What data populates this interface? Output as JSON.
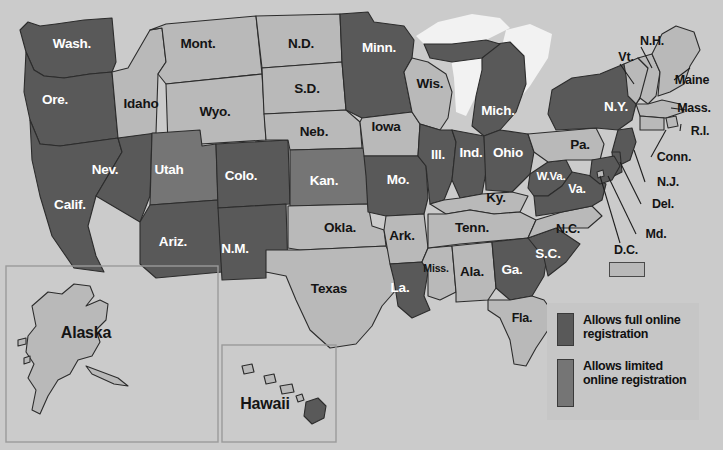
{
  "map": {
    "title": "United States online voter registration map",
    "colors": {
      "full": "#595959",
      "limited": "#757575",
      "none": "#b9b9b9",
      "water": "#f2f2f2",
      "background": "#cbcbcb",
      "border": "#2c2c2c",
      "legend_panel": "#c6c6c6"
    },
    "states": [
      {
        "abbr": "WA",
        "label": "Wash.",
        "status": "full",
        "x": 72,
        "y": 44
      },
      {
        "abbr": "OR",
        "label": "Ore.",
        "status": "full",
        "x": 55,
        "y": 100
      },
      {
        "abbr": "CA",
        "label": "Calif.",
        "status": "full",
        "x": 70,
        "y": 205
      },
      {
        "abbr": "NV",
        "label": "Nev.",
        "status": "full",
        "x": 105,
        "y": 170
      },
      {
        "abbr": "ID",
        "label": "Idaho",
        "status": "none",
        "x": 141,
        "y": 104
      },
      {
        "abbr": "MT",
        "label": "Mont.",
        "status": "none",
        "x": 198,
        "y": 44
      },
      {
        "abbr": "WY",
        "label": "Wyo.",
        "status": "none",
        "x": 215,
        "y": 112
      },
      {
        "abbr": "UT",
        "label": "Utah",
        "status": "limited",
        "x": 169,
        "y": 170
      },
      {
        "abbr": "AZ",
        "label": "Ariz.",
        "status": "full",
        "x": 173,
        "y": 242
      },
      {
        "abbr": "CO",
        "label": "Colo.",
        "status": "full",
        "x": 241,
        "y": 176
      },
      {
        "abbr": "NM",
        "label": "N.M.",
        "status": "full",
        "x": 235,
        "y": 249
      },
      {
        "abbr": "ND",
        "label": "N.D.",
        "status": "none",
        "x": 301,
        "y": 44
      },
      {
        "abbr": "SD",
        "label": "S.D.",
        "status": "none",
        "x": 307,
        "y": 89
      },
      {
        "abbr": "NE",
        "label": "Neb.",
        "status": "none",
        "x": 314,
        "y": 132
      },
      {
        "abbr": "KS",
        "label": "Kan.",
        "status": "limited",
        "x": 324,
        "y": 181
      },
      {
        "abbr": "OK",
        "label": "Okla.",
        "status": "none",
        "x": 340,
        "y": 228
      },
      {
        "abbr": "TX",
        "label": "Texas",
        "status": "none",
        "x": 329,
        "y": 289
      },
      {
        "abbr": "MN",
        "label": "Minn.",
        "status": "full",
        "x": 379,
        "y": 48
      },
      {
        "abbr": "IA",
        "label": "Iowa",
        "status": "none",
        "x": 386,
        "y": 127
      },
      {
        "abbr": "MO",
        "label": "Mo.",
        "status": "full",
        "x": 398,
        "y": 180
      },
      {
        "abbr": "AR",
        "label": "Ark.",
        "status": "none",
        "x": 402,
        "y": 236
      },
      {
        "abbr": "LA",
        "label": "La.",
        "status": "full",
        "x": 400,
        "y": 288
      },
      {
        "abbr": "WI",
        "label": "Wis.",
        "status": "none",
        "x": 430,
        "y": 84
      },
      {
        "abbr": "IL",
        "label": "Ill.",
        "status": "full",
        "x": 438,
        "y": 155
      },
      {
        "abbr": "MS",
        "label": "Miss.",
        "status": "none",
        "x": 436,
        "y": 268
      },
      {
        "abbr": "MI",
        "label": "Mich.",
        "status": "full",
        "x": 498,
        "y": 111
      },
      {
        "abbr": "IN",
        "label": "Ind.",
        "status": "full",
        "x": 471,
        "y": 153
      },
      {
        "abbr": "OH",
        "label": "Ohio",
        "status": "full",
        "x": 508,
        "y": 153
      },
      {
        "abbr": "KY",
        "label": "Ky.",
        "status": "none",
        "x": 496,
        "y": 198
      },
      {
        "abbr": "TN",
        "label": "Tenn.",
        "status": "none",
        "x": 472,
        "y": 228
      },
      {
        "abbr": "AL",
        "label": "Ala.",
        "status": "none",
        "x": 472,
        "y": 272
      },
      {
        "abbr": "GA",
        "label": "Ga.",
        "status": "full",
        "x": 512,
        "y": 270
      },
      {
        "abbr": "FL",
        "label": "Fla.",
        "status": "none",
        "x": 522,
        "y": 318
      },
      {
        "abbr": "SC",
        "label": "S.C.",
        "status": "full",
        "x": 548,
        "y": 254
      },
      {
        "abbr": "NC",
        "label": "N.C.",
        "status": "none",
        "x": 568,
        "y": 229
      },
      {
        "abbr": "WV",
        "label": "W.Va.",
        "status": "full",
        "x": 551,
        "y": 177
      },
      {
        "abbr": "VA",
        "label": "Va.",
        "status": "full",
        "x": 577,
        "y": 189
      },
      {
        "abbr": "PA",
        "label": "Pa.",
        "status": "none",
        "x": 580,
        "y": 145
      },
      {
        "abbr": "NY",
        "label": "N.Y.",
        "status": "full",
        "x": 616,
        "y": 107
      }
    ],
    "callouts": [
      {
        "abbr": "NH",
        "label": "N.H.",
        "x": 652,
        "y": 41
      },
      {
        "abbr": "VT",
        "label": "Vt.",
        "x": 626,
        "y": 57
      },
      {
        "abbr": "ME",
        "label": "Maine",
        "x": 692,
        "y": 80
      },
      {
        "abbr": "MA",
        "label": "Mass.",
        "x": 694,
        "y": 108
      },
      {
        "abbr": "RI",
        "label": "R.I.",
        "x": 700,
        "y": 131
      },
      {
        "abbr": "CT",
        "label": "Conn.",
        "x": 674,
        "y": 157
      },
      {
        "abbr": "NJ",
        "label": "N.J.",
        "x": 668,
        "y": 182
      },
      {
        "abbr": "DE",
        "label": "Del.",
        "x": 663,
        "y": 204
      },
      {
        "abbr": "MD",
        "label": "Md.",
        "x": 656,
        "y": 234
      },
      {
        "abbr": "DC",
        "label": "D.C.",
        "x": 626,
        "y": 250
      }
    ],
    "insets": [
      {
        "name": "alaska",
        "label": "Alaska",
        "x": 86,
        "y": 333
      },
      {
        "name": "hawaii",
        "label": "Hawaii",
        "x": 265,
        "y": 404
      }
    ]
  },
  "legend": {
    "items": [
      {
        "swatch": "full",
        "text": "Allows full online registration"
      },
      {
        "swatch": "limited",
        "text": "Allows limited online registration"
      }
    ]
  }
}
